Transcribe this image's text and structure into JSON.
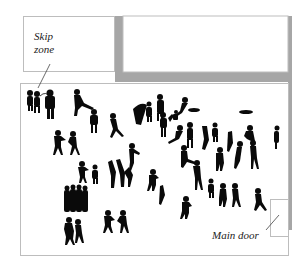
{
  "labels": {
    "skip_zone_line1": "Skip",
    "skip_zone_line2": "zone",
    "main_door": "Main door"
  },
  "colors": {
    "wall_gray": "#a6a6a6",
    "border_gray": "#bdbdbd",
    "silhouette": "#0a0a0a",
    "background": "#ffffff"
  },
  "regions": [
    {
      "name": "skip-zone",
      "type": "annotated-area"
    },
    {
      "name": "upper-room",
      "type": "room"
    },
    {
      "name": "main-hall",
      "type": "room"
    },
    {
      "name": "main-door",
      "type": "entrance"
    }
  ]
}
